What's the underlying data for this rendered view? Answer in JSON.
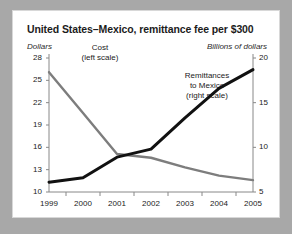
{
  "figure": {
    "title": "United States–Mexico, remittance fee per $300",
    "left_axis_unit": "Dollars",
    "right_axis_unit": "Billions of dollars",
    "background_color": "#ffffff",
    "page_color": "#a8a8a8"
  },
  "labels": {
    "cost": "Cost\n(left scale)",
    "cost_line1": "Cost",
    "cost_line2": "(left scale)",
    "remit_line1": "Remittances",
    "remit_line2": "to Mexico",
    "remit_line3": "(right scale)"
  },
  "chart_data": {
    "type": "line",
    "title": "United States–Mexico, remittance fee per $300",
    "xlabel": "",
    "ylabel": "Dollars",
    "y2label": "Billions of dollars",
    "x": [
      "1999",
      "2000",
      "2001",
      "2002",
      "2003",
      "2004",
      "2005"
    ],
    "xlim": [
      1999,
      2005
    ],
    "ylim": [
      10,
      28
    ],
    "yticks": [
      10,
      13,
      16,
      19,
      22,
      25,
      28
    ],
    "y2lim": [
      5,
      20
    ],
    "y2ticks": [
      5,
      10,
      15,
      20
    ],
    "grid": false,
    "legend": "inline-annotations",
    "series": [
      {
        "name": "Cost (left scale)",
        "axis": "left",
        "color": "#7d7d7d",
        "unit": "Dollars",
        "values": [
          26.1,
          20.6,
          15.1,
          14.6,
          13.3,
          12.2,
          11.6
        ]
      },
      {
        "name": "Remittances to Mexico (right scale)",
        "axis": "right",
        "color": "#111111",
        "unit": "Billions of dollars",
        "values": [
          6.1,
          6.6,
          8.9,
          9.8,
          13.3,
          16.6,
          18.7
        ]
      }
    ]
  }
}
